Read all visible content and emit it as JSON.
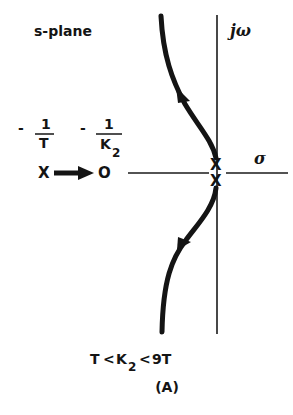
{
  "diagram": {
    "type": "root-locus",
    "plane_label": "s-plane",
    "axes": {
      "imag_label": "jω",
      "real_label": "σ"
    },
    "markers": {
      "pole_left": {
        "symbol": "X",
        "label_prefix": "-",
        "label_num": "1",
        "label_den": "T"
      },
      "zero": {
        "symbol": "O",
        "label_prefix": "-",
        "label_num": "1",
        "label_den": "K",
        "label_den_sub": "2"
      },
      "pole_upper": {
        "symbol": "X"
      },
      "pole_lower": {
        "symbol": "X"
      }
    },
    "branches": [
      {
        "name": "upper",
        "direction": "away from origin, upward-left"
      },
      {
        "name": "lower",
        "direction": "away from origin, downward-left"
      },
      {
        "name": "real-axis",
        "direction": "from -1/T toward -1/K2"
      }
    ],
    "condition": {
      "left": "T",
      "op1": "<",
      "mid": "K",
      "mid_sub": "2",
      "op2": "<",
      "right": "9T"
    },
    "caption": "(A)"
  }
}
